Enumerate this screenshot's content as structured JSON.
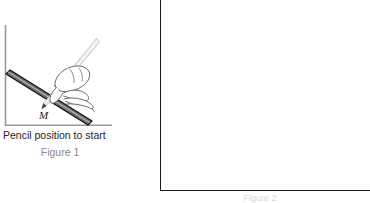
{
  "figure1": {
    "caption": "Pencil position to start",
    "number": "Figure 1",
    "mass_label": "M",
    "icon_names": {
      "wall": "vertical-wall-line",
      "ground": "horizontal-ground-line",
      "bar": "inclined-bar",
      "hand": "hand-holding-pencil",
      "pencil": "pencil"
    },
    "colors": {
      "bar_fill": "#6e6e6e",
      "bar_outline": "#111111",
      "wall": "#999999",
      "ground": "#999999",
      "caption_text": "#262626",
      "number_text": "#8a8a8a",
      "hand_outline": "#555555",
      "pencil_fill": "#f2f2f2"
    }
  },
  "figure2": {
    "number": "Figure 2",
    "colors": {
      "border": "#1a1a1a",
      "fill": "#ffffff",
      "number_text": "#d8d8d8"
    }
  }
}
